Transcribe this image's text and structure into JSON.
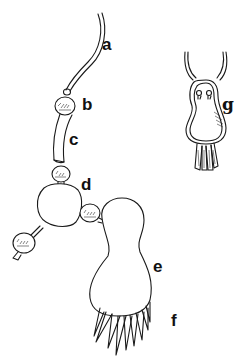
{
  "figure": {
    "type": "line drawing",
    "labels": [
      {
        "id": "a",
        "text": "a",
        "x": 102,
        "y": 48
      },
      {
        "id": "b",
        "text": "b",
        "x": 82,
        "y": 96
      },
      {
        "id": "c",
        "text": "c",
        "x": 69,
        "y": 131
      },
      {
        "id": "d",
        "text": "d",
        "x": 81,
        "y": 178
      },
      {
        "id": "e",
        "text": "e",
        "x": 153,
        "y": 260
      },
      {
        "id": "f",
        "text": "f",
        "x": 172,
        "y": 315
      },
      {
        "id": "g",
        "text": "g",
        "x": 224,
        "y": 98
      }
    ],
    "colors": {
      "ink": "#1a1a1a",
      "background": "#ffffff"
    }
  }
}
